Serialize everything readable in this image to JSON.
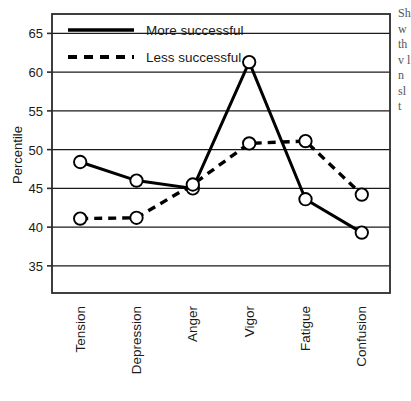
{
  "chart_data": {
    "type": "line",
    "title": "",
    "xlabel": "",
    "ylabel": "Percentile",
    "categories": [
      "Tension",
      "Depression",
      "Anger",
      "Vigor",
      "Fatigue",
      "Confusion"
    ],
    "series": [
      {
        "name": "More successful",
        "style": "solid",
        "marker": "open-circle",
        "values": [
          48.4,
          46.0,
          45.0,
          61.3,
          43.6,
          39.3
        ]
      },
      {
        "name": "Less successful",
        "style": "dashed",
        "marker": "open-circle",
        "values": [
          41.1,
          41.2,
          45.5,
          50.8,
          51.1,
          44.2
        ]
      }
    ],
    "ylim": [
      31.5,
      67.5
    ],
    "yticks": [
      35,
      40,
      45,
      50,
      55,
      60,
      65
    ],
    "ytick_labels": [
      "35",
      "40",
      "45",
      "50",
      "55",
      "60",
      "65"
    ],
    "grid": {
      "horizontal": true,
      "vertical": false,
      "color": "#1a1a1a"
    },
    "legend": {
      "position": "top-left-inside",
      "entries": [
        "More successful",
        "Less successful"
      ]
    },
    "colors": {
      "line": "#000000",
      "marker_fill": "#ffffff",
      "marker_stroke": "#000000",
      "axis": "#2b2b2b",
      "text": "#1a1a1a",
      "background": "#ffffff"
    }
  },
  "side_text": {
    "fragment": "Sh w th v l n sl t"
  }
}
